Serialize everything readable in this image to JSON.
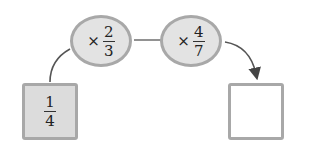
{
  "start": {
    "numerator": "1",
    "denominator": "4"
  },
  "operations": [
    {
      "operator": "×",
      "numerator": "2",
      "denominator": "3"
    },
    {
      "operator": "×",
      "numerator": "4",
      "denominator": "7"
    }
  ],
  "result": {
    "value": ""
  },
  "colors": {
    "fill": "#e3e3e3",
    "border": "#a8a8a8",
    "line": "#555555"
  }
}
